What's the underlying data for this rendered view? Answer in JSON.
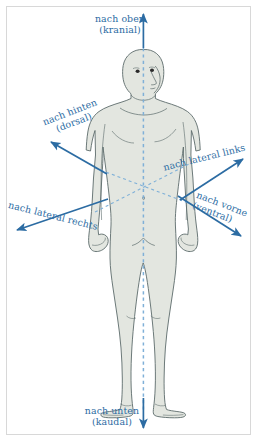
{
  "figure": {
    "frame_color": "#d8d8d8",
    "background_color": "#ffffff"
  },
  "body_figure": {
    "name": "human-body-outline",
    "fill_color": "#e3e6e0",
    "outline_color": "#5c6b6b",
    "view": "three-quarter-front",
    "midline_color": "#7fb0d8"
  },
  "axes": {
    "arrow_color": "#2c6ca3",
    "dashed_color": "#7fb0d8",
    "center": {
      "x": 143,
      "y": 186
    },
    "labels": {
      "cranial": {
        "line1": "nach oben",
        "line2": "(kranial)"
      },
      "kaudal": {
        "line1": "nach unten",
        "line2": "(kaudal)"
      },
      "dorsal": {
        "line1": "nach hinten",
        "line2": "(dorsal)"
      },
      "ventral": {
        "line1": "nach vorne",
        "line2": "(ventral)"
      },
      "lateral_links": {
        "line1": "nach lateral links"
      },
      "lateral_rechts": {
        "line1": "nach lateral rechts"
      }
    }
  }
}
